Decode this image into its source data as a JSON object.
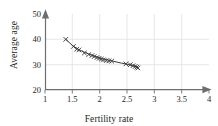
{
  "chart_data": {
    "type": "scatter",
    "title": "",
    "xlabel": "Fertility rate",
    "ylabel": "Average age",
    "xlim": [
      1,
      4
    ],
    "ylim": [
      20,
      50
    ],
    "xticks": [
      "1",
      "1.5",
      "2",
      "2.5",
      "3",
      "3.5",
      "4"
    ],
    "xtick_values": [
      1,
      1.5,
      2,
      2.5,
      3,
      3.5,
      4
    ],
    "yticks": [
      "20",
      "30",
      "40",
      "50"
    ],
    "ytick_values": [
      20,
      30,
      40,
      50
    ],
    "grid": "on",
    "grid_color": "#d9d9d9",
    "axis_color": "#6b6b6b",
    "marker": "x",
    "marker_color": "#3a3a3a",
    "line_color": "#3a3a3a",
    "legend": "none",
    "x": [
      1.38,
      1.52,
      1.58,
      1.62,
      1.72,
      1.8,
      1.86,
      1.9,
      1.95,
      1.99,
      2.03,
      2.07,
      2.12,
      2.17,
      2.22,
      2.48,
      2.56,
      2.61,
      2.65,
      2.68,
      2.7
    ],
    "values": [
      40.0,
      37.2,
      36.1,
      35.8,
      34.6,
      34.0,
      33.6,
      33.2,
      32.8,
      32.5,
      32.2,
      31.9,
      31.6,
      31.5,
      31.4,
      30.3,
      30.0,
      29.6,
      29.3,
      29.0,
      28.7
    ],
    "series": [
      {
        "name": "observations",
        "values": [
          40.0,
          37.2,
          36.1,
          35.8,
          34.6,
          34.0,
          33.6,
          33.2,
          32.8,
          32.5,
          32.2,
          31.9,
          31.6,
          31.5,
          31.4,
          30.3,
          30.0,
          29.6,
          29.3,
          29.0,
          28.7
        ]
      }
    ],
    "fit_curve": {
      "name": "trend",
      "x": [
        1.38,
        1.5,
        1.6,
        1.7,
        1.8,
        1.9,
        2.0,
        2.1,
        2.2,
        2.3,
        2.4,
        2.5,
        2.6,
        2.7
      ],
      "y": [
        40.0,
        37.6,
        36.2,
        35.1,
        34.2,
        33.4,
        32.7,
        32.1,
        31.6,
        31.1,
        30.6,
        30.2,
        29.6,
        28.9
      ]
    }
  }
}
